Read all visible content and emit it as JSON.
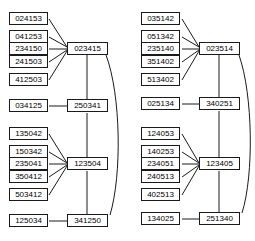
{
  "figure": {
    "type": "graph-diagram",
    "node_border_color": "#1a1a1a",
    "edge_color": "#1a1a1a",
    "background_color": "#ffffff"
  },
  "diagrams": [
    {
      "id": "left-diagram",
      "groups": [
        {
          "id": "left-group-1",
          "hub": "023415",
          "leaves": [
            "024153",
            "041253",
            "234150",
            "241503",
            "412503"
          ]
        },
        {
          "id": "left-group-2",
          "hub": "250341",
          "leaves": [
            "034125"
          ]
        },
        {
          "id": "left-group-3",
          "hub": "123504",
          "leaves": [
            "135042",
            "150342",
            "235041",
            "350412",
            "503412"
          ]
        },
        {
          "id": "left-group-4",
          "hub": "341250",
          "leaves": [
            "125034"
          ]
        }
      ],
      "hub_chain": [
        "023415",
        "250341",
        "123504",
        "341250"
      ],
      "arc_label": "023415-341250"
    },
    {
      "id": "right-diagram",
      "groups": [
        {
          "id": "right-group-1",
          "hub": "023514",
          "leaves": [
            "035142",
            "051342",
            "235140",
            "351402",
            "513402"
          ]
        },
        {
          "id": "right-group-2",
          "hub": "340251",
          "leaves": [
            "025134"
          ]
        },
        {
          "id": "right-group-3",
          "hub": "123405",
          "leaves": [
            "124053",
            "140253",
            "234051",
            "240513",
            "402513"
          ]
        },
        {
          "id": "right-group-4",
          "hub": "251340",
          "leaves": [
            "134025"
          ]
        }
      ],
      "hub_chain": [
        "023514",
        "340251",
        "123405",
        "251340"
      ],
      "arc_label": "023514-251340"
    }
  ]
}
